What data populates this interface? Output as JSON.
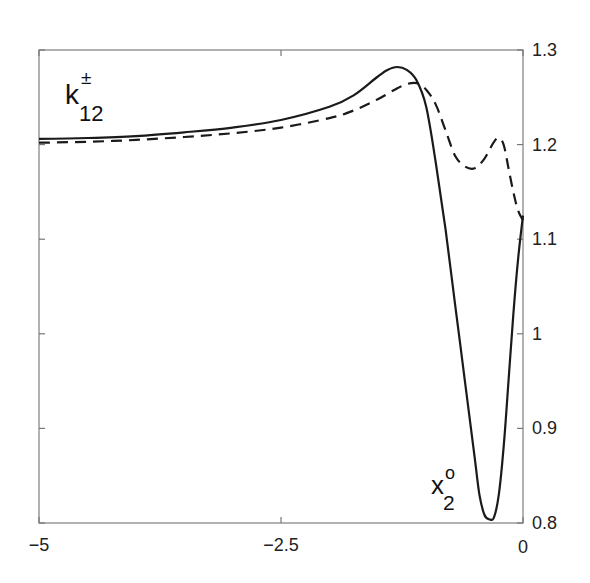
{
  "chart_data": {
    "type": "line",
    "title": "",
    "xlabel": "",
    "ylabel": "",
    "xlim": [
      -5,
      0
    ],
    "ylim": [
      0.8,
      1.3
    ],
    "grid": false,
    "y_axis_side": "right",
    "x_ticks": [
      -5,
      -2.5,
      0
    ],
    "x_tick_labels": [
      "-5",
      "-2.5",
      "0"
    ],
    "y_ticks": [
      0.8,
      0.9,
      1.0,
      1.1,
      1.2,
      1.3
    ],
    "y_tick_labels": [
      "0.8",
      "0.9",
      "1",
      "1.1",
      "1.2",
      "1.3"
    ],
    "annotations": [
      {
        "text": "k",
        "superscript": "±",
        "subscript": "12",
        "position": "upper-left"
      },
      {
        "text": "x",
        "superscript": "o",
        "subscript": "2",
        "position": "lower-right"
      }
    ],
    "series": [
      {
        "name": "solid",
        "style": "solid",
        "x": [
          -5.0,
          -4.5,
          -4.0,
          -3.5,
          -3.0,
          -2.5,
          -2.0,
          -1.75,
          -1.5,
          -1.4,
          -1.3,
          -1.2,
          -1.1,
          -1.0,
          -0.9,
          -0.8,
          -0.7,
          -0.6,
          -0.5,
          -0.45,
          -0.4,
          -0.35,
          -0.3,
          -0.25,
          -0.2,
          -0.15,
          -0.1,
          -0.05,
          0.0
        ],
        "y": [
          1.206,
          1.207,
          1.209,
          1.213,
          1.218,
          1.226,
          1.24,
          1.252,
          1.272,
          1.279,
          1.282,
          1.279,
          1.268,
          1.24,
          1.18,
          1.11,
          1.03,
          0.95,
          0.87,
          0.83,
          0.809,
          0.804,
          0.806,
          0.83,
          0.88,
          0.95,
          1.02,
          1.08,
          1.125
        ]
      },
      {
        "name": "dashed",
        "style": "dashed",
        "x": [
          -5.0,
          -4.5,
          -4.0,
          -3.5,
          -3.0,
          -2.5,
          -2.0,
          -1.75,
          -1.5,
          -1.25,
          -1.1,
          -1.0,
          -0.9,
          -0.8,
          -0.7,
          -0.6,
          -0.5,
          -0.4,
          -0.3,
          -0.25,
          -0.2,
          -0.15,
          -0.1,
          -0.05,
          0.0
        ],
        "y": [
          1.202,
          1.203,
          1.205,
          1.208,
          1.212,
          1.218,
          1.228,
          1.236,
          1.248,
          1.262,
          1.265,
          1.258,
          1.242,
          1.215,
          1.188,
          1.177,
          1.175,
          1.185,
          1.203,
          1.207,
          1.2,
          1.175,
          1.15,
          1.13,
          1.12
        ]
      }
    ]
  }
}
